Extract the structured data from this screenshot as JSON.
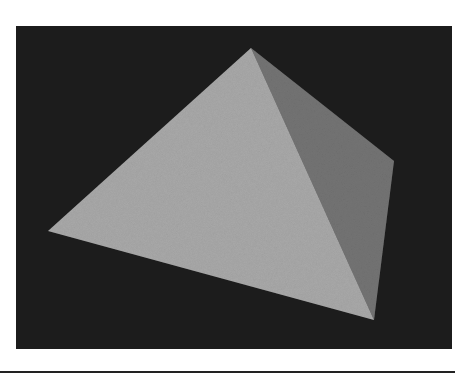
{
  "figure": {
    "colors": {
      "background": "#1f1f1f",
      "lit_face": "#a9a9a9",
      "shaded_face": "#747474",
      "page": "#ffffff",
      "rule": "#222222"
    },
    "vertices": {
      "apex": [
        235,
        22
      ],
      "left": [
        32,
        205
      ],
      "bottom": [
        358,
        294
      ],
      "right": [
        378,
        135
      ]
    }
  }
}
